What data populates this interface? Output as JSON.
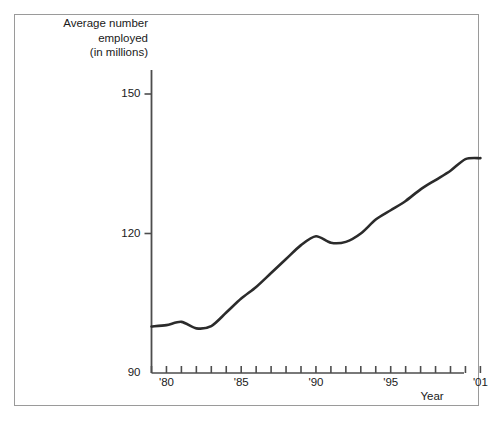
{
  "figure": {
    "y_axis_title": "Average number\nemployed\n(in millions)",
    "x_axis_title": "Year",
    "line_color": "#2b2b2b",
    "axis_color": "#4d4d4d",
    "frame_color": "#9a9a9a",
    "background": "#ffffff"
  },
  "chart_data": {
    "type": "line",
    "title": "",
    "subtitle": "",
    "xlabel": "Year",
    "ylabel": "Average number employed (in millions)",
    "xlim": [
      1979,
      2001
    ],
    "ylim": [
      90,
      153
    ],
    "grid": false,
    "legend": "none",
    "y_ticks": [
      90,
      120,
      150
    ],
    "y_tick_labels": [
      "90",
      "120",
      "150"
    ],
    "x_ticks": [
      1979,
      1980,
      1981,
      1982,
      1983,
      1984,
      1985,
      1986,
      1987,
      1988,
      1989,
      1990,
      1991,
      1992,
      1993,
      1994,
      1995,
      1996,
      1997,
      1998,
      1999,
      2000,
      2001
    ],
    "x_tick_labels": [
      {
        "x": 1980,
        "label": "'80"
      },
      {
        "x": 1985,
        "label": "'85"
      },
      {
        "x": 1990,
        "label": "'90"
      },
      {
        "x": 1995,
        "label": "'95"
      },
      {
        "x": 2001,
        "label": "'01"
      }
    ],
    "x": [
      1979,
      1980,
      1981,
      1982,
      1983,
      1984,
      1985,
      1986,
      1987,
      1988,
      1989,
      1990,
      1991,
      1992,
      1993,
      1994,
      1995,
      1996,
      1997,
      1998,
      1999,
      2000,
      2001
    ],
    "values": [
      100.0,
      100.3,
      101.0,
      99.6,
      100.1,
      103.0,
      106.0,
      108.5,
      111.5,
      114.5,
      117.5,
      119.4,
      118.0,
      118.2,
      120.0,
      123.0,
      125.0,
      127.0,
      129.5,
      131.5,
      133.5,
      136.0,
      136.2
    ],
    "series": [
      {
        "name": "Average number employed (in millions)",
        "values": [
          100.0,
          100.3,
          101.0,
          99.6,
          100.1,
          103.0,
          106.0,
          108.5,
          111.5,
          114.5,
          117.5,
          119.4,
          118.0,
          118.2,
          120.0,
          123.0,
          125.0,
          127.0,
          129.5,
          131.5,
          133.5,
          136.0,
          136.2
        ]
      }
    ]
  }
}
